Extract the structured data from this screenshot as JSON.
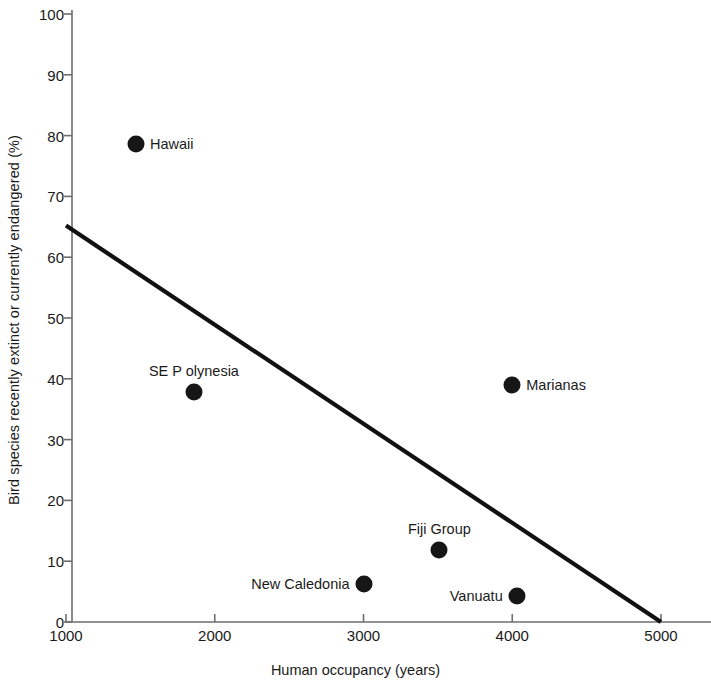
{
  "chart_data": {
    "type": "scatter",
    "title": "",
    "xlabel": "Human occupancy (years)",
    "ylabel": "Bird species recently extinct or currently endangered (%)",
    "xlim": [
      1000,
      5000
    ],
    "ylim": [
      0,
      100
    ],
    "xticks": [
      1000,
      2000,
      3000,
      4000,
      5000
    ],
    "xtick_labels": [
      "1000",
      "2000",
      "3000",
      "4000",
      "5000"
    ],
    "yticks": [
      0,
      10,
      20,
      30,
      40,
      50,
      60,
      70,
      80,
      90,
      100
    ],
    "ytick_labels": [
      "0",
      "10",
      "20",
      "30",
      "40",
      "50",
      "60",
      "70",
      "80",
      "90",
      "100"
    ],
    "grid": false,
    "legend": "none",
    "points": [
      {
        "label": "Hawaii",
        "x": 1470,
        "y": 78.6,
        "label_side": "right"
      },
      {
        "label": "SE P olynesia",
        "x": 1860,
        "y": 37.8,
        "label_side": "above"
      },
      {
        "label": "Marianas",
        "x": 4000,
        "y": 39.0,
        "label_side": "right"
      },
      {
        "label": "Fiji Group",
        "x": 3510,
        "y": 11.9,
        "label_side": "above"
      },
      {
        "label": "New Caledonia",
        "x": 3000,
        "y": 6.3,
        "label_side": "left"
      },
      {
        "label": "Vanuatu",
        "x": 4030,
        "y": 4.2,
        "label_side": "left"
      }
    ],
    "trend_line": {
      "name": "regression-line",
      "x": [
        1000,
        5000
      ],
      "y": [
        65.2,
        0
      ]
    },
    "colors": {
      "marker": "#161616",
      "trend_line": "#111111",
      "axis": "#6e6e6e",
      "text": "#1a1a1a",
      "background": "#ffffff"
    }
  }
}
